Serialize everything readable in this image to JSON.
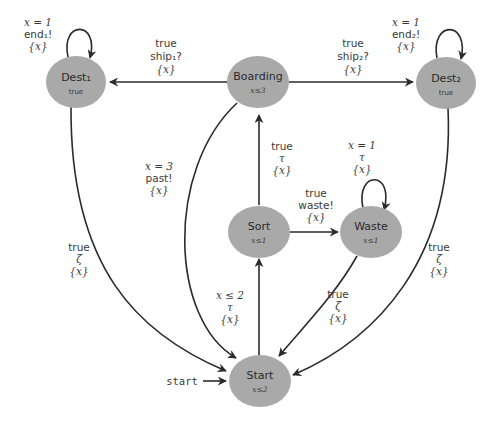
{
  "diagram": {
    "type": "timed-automaton",
    "nodes": [
      {
        "id": "dest1",
        "name": "Dest₁",
        "invariant": "true"
      },
      {
        "id": "boarding",
        "name": "Boarding",
        "invariant": "x≤3"
      },
      {
        "id": "dest2",
        "name": "Dest₂",
        "invariant": "true"
      },
      {
        "id": "sort",
        "name": "Sort",
        "invariant": "x≤1"
      },
      {
        "id": "waste",
        "name": "Waste",
        "invariant": "x≤1"
      },
      {
        "id": "start",
        "name": "Start",
        "invariant": "x≤2"
      }
    ],
    "edges": [
      {
        "id": "dest1-loop",
        "from": "dest1",
        "to": "dest1",
        "guard": "x = 1",
        "action": "end₁!",
        "reset": "{x}"
      },
      {
        "id": "boarding-dest1",
        "from": "boarding",
        "to": "dest1",
        "guard": "true",
        "action": "ship₁?",
        "reset": "{x}"
      },
      {
        "id": "boarding-dest2",
        "from": "boarding",
        "to": "dest2",
        "guard": "true",
        "action": "ship₂?",
        "reset": "{x}"
      },
      {
        "id": "dest2-loop",
        "from": "dest2",
        "to": "dest2",
        "guard": "x = 1",
        "action": "end₂!",
        "reset": "{x}"
      },
      {
        "id": "sort-boarding",
        "from": "sort",
        "to": "boarding",
        "guard": "true",
        "action": "τ",
        "reset": "{x}"
      },
      {
        "id": "waste-loop",
        "from": "waste",
        "to": "waste",
        "guard": "x = 1",
        "action": "τ",
        "reset": "{x}"
      },
      {
        "id": "sort-waste",
        "from": "sort",
        "to": "waste",
        "guard": "true",
        "action": "waste!",
        "reset": "{x}"
      },
      {
        "id": "boarding-start",
        "from": "boarding",
        "to": "start",
        "guard": "x = 3",
        "action": "past!",
        "reset": "{x}"
      },
      {
        "id": "dest1-start",
        "from": "dest1",
        "to": "start",
        "guard": "true",
        "action": "ζ",
        "reset": "{x}"
      },
      {
        "id": "start-sort",
        "from": "start",
        "to": "sort",
        "guard": "x ≤ 2",
        "action": "τ",
        "reset": "{x}"
      },
      {
        "id": "waste-start",
        "from": "waste",
        "to": "start",
        "guard": "true",
        "action": "ζ",
        "reset": "{x}"
      },
      {
        "id": "dest2-start",
        "from": "dest2",
        "to": "start",
        "guard": "true",
        "action": "ζ",
        "reset": "{x}"
      }
    ],
    "initial": {
      "label": "start",
      "target": "start"
    },
    "colors": {
      "node_fill": "#a9a9a9",
      "edge": "#2b2b2b",
      "text": "#3a3a3a"
    }
  }
}
